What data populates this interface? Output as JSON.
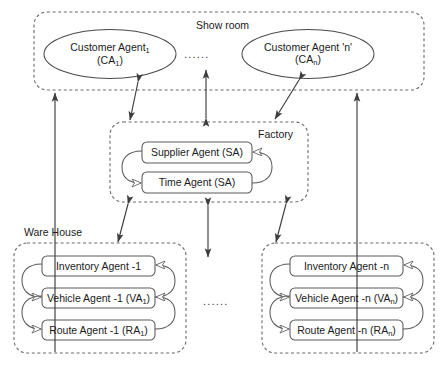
{
  "diagram": {
    "groups": {
      "showroom": {
        "label": "Show room"
      },
      "factory": {
        "label": "Factory"
      },
      "warehouse_left": {
        "label": "Ware House"
      }
    },
    "customer_agents": [
      {
        "line1": "Customer Agent",
        "sub1": "1",
        "line2": "(CA",
        "sub2": "1",
        "line2_end": ")"
      },
      {
        "line1": "Customer Agent 'n'",
        "sub1": "",
        "line2": "(CA",
        "sub2": "n",
        "line2_end": ")"
      }
    ],
    "factory_agents": [
      {
        "label": "Supplier Agent (SA)"
      },
      {
        "label": "Time Agent (SA)"
      }
    ],
    "warehouse_left_agents": [
      {
        "pre": "Inventory Agent -1",
        "sub": "",
        "post": ""
      },
      {
        "pre": "Vehicle Agent -1 (VA",
        "sub": "1",
        "post": ")"
      },
      {
        "pre": "Route Agent -1 (RA",
        "sub": "1",
        "post": ")"
      }
    ],
    "warehouse_right_agents": [
      {
        "pre": "Inventory Agent -n",
        "sub": "",
        "post": ""
      },
      {
        "pre": "Vehicle Agent -n (VA",
        "sub": "n",
        "post": ")"
      },
      {
        "pre": "Route Agent -n (RA",
        "sub": "n",
        "post": ")"
      }
    ],
    "ellipsis": {
      "showroom": "......",
      "warehouse": "......"
    },
    "colors": {
      "stroke": "#4a4a4a",
      "dashed_stroke": "#6b6b6b",
      "text": "#1a1a1a",
      "background": "#ffffff"
    }
  }
}
